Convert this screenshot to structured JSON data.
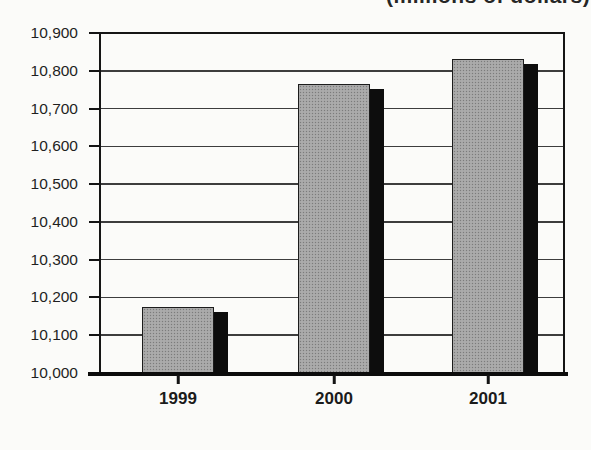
{
  "caption": {
    "text": "(millions of dollars)"
  },
  "chart_data": {
    "type": "bar",
    "title": "(millions of dollars)",
    "categories": [
      "1999",
      "2000",
      "2001"
    ],
    "values": [
      10175,
      10765,
      10830
    ],
    "xlabel": "",
    "ylabel": "",
    "ylim": [
      10000,
      10900
    ],
    "ytick_step": 100,
    "ytick_labels_top_to_bottom": [
      "10,900",
      "10,800",
      "10,700",
      "10,600",
      "10,500",
      "10,400",
      "10,300",
      "10,200",
      "10,100",
      "10,000"
    ],
    "grid": true,
    "legend": "none",
    "bar_fill_color": "#a6a6a6",
    "bar_shadow_color": "#0d0d0d",
    "frame_color": "#151515",
    "background_color": "#fbfbf9"
  }
}
